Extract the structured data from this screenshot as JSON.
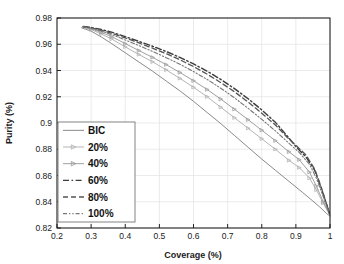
{
  "chart_data": {
    "type": "line",
    "title": "",
    "xlabel": "Coverage (%)",
    "ylabel": "Purity (%)",
    "xlim": [
      0.2,
      1.0
    ],
    "ylim": [
      0.82,
      0.98
    ],
    "xticks": [
      "0.2",
      "0.3",
      "0.4",
      "0.5",
      "0.6",
      "0.7",
      "0.8",
      "0.9",
      "1"
    ],
    "xtick_values": [
      0.2,
      0.3,
      0.4,
      0.5,
      0.6,
      0.7,
      0.8,
      0.9,
      1.0
    ],
    "yticks": [
      "0.82",
      "0.84",
      "0.86",
      "0.88",
      "0.9",
      "0.92",
      "0.94",
      "0.96",
      "0.98"
    ],
    "ytick_values": [
      0.82,
      0.84,
      0.86,
      0.88,
      0.9,
      0.92,
      0.94,
      0.96,
      0.98
    ],
    "grid": true,
    "legend_position": "lower-left",
    "series": [
      {
        "name": "BIC",
        "style": "solid",
        "color": "#8a8a8a",
        "marker": "none",
        "width": 1.0,
        "x": [
          0.272,
          0.3,
          0.33,
          0.36,
          0.4,
          0.44,
          0.48,
          0.52,
          0.56,
          0.6,
          0.64,
          0.68,
          0.72,
          0.76,
          0.8,
          0.84,
          0.88,
          0.92,
          0.95,
          0.97,
          0.99,
          1.0
        ],
        "y": [
          0.9725,
          0.97,
          0.9655,
          0.9605,
          0.9535,
          0.9465,
          0.9395,
          0.932,
          0.9245,
          0.9165,
          0.908,
          0.8995,
          0.8905,
          0.8815,
          0.8725,
          0.864,
          0.8555,
          0.847,
          0.8405,
          0.836,
          0.831,
          0.829
        ]
      },
      {
        "name": "20%",
        "style": "solid-marker",
        "color": "#b5b5b5",
        "marker": "triangle-right",
        "width": 1.0,
        "x": [
          0.274,
          0.3,
          0.33,
          0.36,
          0.4,
          0.44,
          0.48,
          0.52,
          0.56,
          0.6,
          0.64,
          0.68,
          0.72,
          0.76,
          0.8,
          0.84,
          0.88,
          0.91,
          0.94,
          0.96,
          0.98,
          1.0
        ],
        "y": [
          0.973,
          0.9712,
          0.9678,
          0.964,
          0.958,
          0.9522,
          0.9466,
          0.9405,
          0.934,
          0.9272,
          0.92,
          0.912,
          0.904,
          0.896,
          0.888,
          0.88,
          0.8715,
          0.866,
          0.858,
          0.849,
          0.839,
          0.8295
        ]
      },
      {
        "name": "40%",
        "style": "solid-marker",
        "color": "#a0a0a0",
        "marker": "triangle-right",
        "width": 1.0,
        "x": [
          0.275,
          0.3,
          0.33,
          0.36,
          0.4,
          0.44,
          0.48,
          0.52,
          0.56,
          0.6,
          0.64,
          0.68,
          0.72,
          0.76,
          0.8,
          0.84,
          0.88,
          0.91,
          0.94,
          0.96,
          0.98,
          1.0
        ],
        "y": [
          0.9732,
          0.9718,
          0.969,
          0.9658,
          0.9605,
          0.9552,
          0.95,
          0.9445,
          0.9385,
          0.9322,
          0.9255,
          0.9182,
          0.9105,
          0.9025,
          0.8945,
          0.8865,
          0.878,
          0.872,
          0.8625,
          0.852,
          0.84,
          0.8298
        ]
      },
      {
        "name": "60%",
        "style": "dashdot",
        "color": "#3c3c3c",
        "marker": "none",
        "width": 1.4,
        "x": [
          0.277,
          0.3,
          0.33,
          0.36,
          0.4,
          0.44,
          0.48,
          0.52,
          0.56,
          0.6,
          0.64,
          0.68,
          0.72,
          0.76,
          0.8,
          0.84,
          0.875,
          0.9,
          0.93,
          0.955,
          0.975,
          1.0
        ],
        "y": [
          0.9735,
          0.9728,
          0.9712,
          0.9692,
          0.9658,
          0.9622,
          0.9585,
          0.9545,
          0.95,
          0.945,
          0.9395,
          0.9332,
          0.9262,
          0.9185,
          0.91,
          0.9005,
          0.89,
          0.882,
          0.874,
          0.864,
          0.85,
          0.83
        ]
      },
      {
        "name": "80%",
        "style": "dashed",
        "color": "#555555",
        "marker": "none",
        "width": 1.3,
        "x": [
          0.277,
          0.3,
          0.33,
          0.36,
          0.4,
          0.44,
          0.48,
          0.52,
          0.56,
          0.6,
          0.64,
          0.68,
          0.72,
          0.76,
          0.8,
          0.84,
          0.875,
          0.9,
          0.93,
          0.955,
          0.975,
          1.0
        ],
        "y": [
          0.9734,
          0.9725,
          0.9706,
          0.9684,
          0.9648,
          0.961,
          0.957,
          0.9528,
          0.9482,
          0.943,
          0.9372,
          0.9308,
          0.9238,
          0.916,
          0.9075,
          0.8985,
          0.889,
          0.883,
          0.8755,
          0.865,
          0.8505,
          0.83
        ]
      },
      {
        "name": "100%",
        "style": "dashdotdot",
        "color": "#777777",
        "marker": "none",
        "width": 1.1,
        "x": [
          0.276,
          0.3,
          0.33,
          0.36,
          0.4,
          0.44,
          0.48,
          0.52,
          0.56,
          0.6,
          0.64,
          0.68,
          0.72,
          0.76,
          0.8,
          0.84,
          0.88,
          0.91,
          0.94,
          0.96,
          0.98,
          1.0
        ],
        "y": [
          0.9733,
          0.9722,
          0.97,
          0.9674,
          0.9632,
          0.959,
          0.9545,
          0.9498,
          0.9448,
          0.9392,
          0.9332,
          0.9265,
          0.9192,
          0.9112,
          0.9028,
          0.894,
          0.8845,
          0.8775,
          0.8685,
          0.858,
          0.844,
          0.8296
        ]
      }
    ]
  },
  "legend": {
    "items": [
      "BIC",
      "20%",
      "40%",
      "60%",
      "80%",
      "100%"
    ]
  }
}
